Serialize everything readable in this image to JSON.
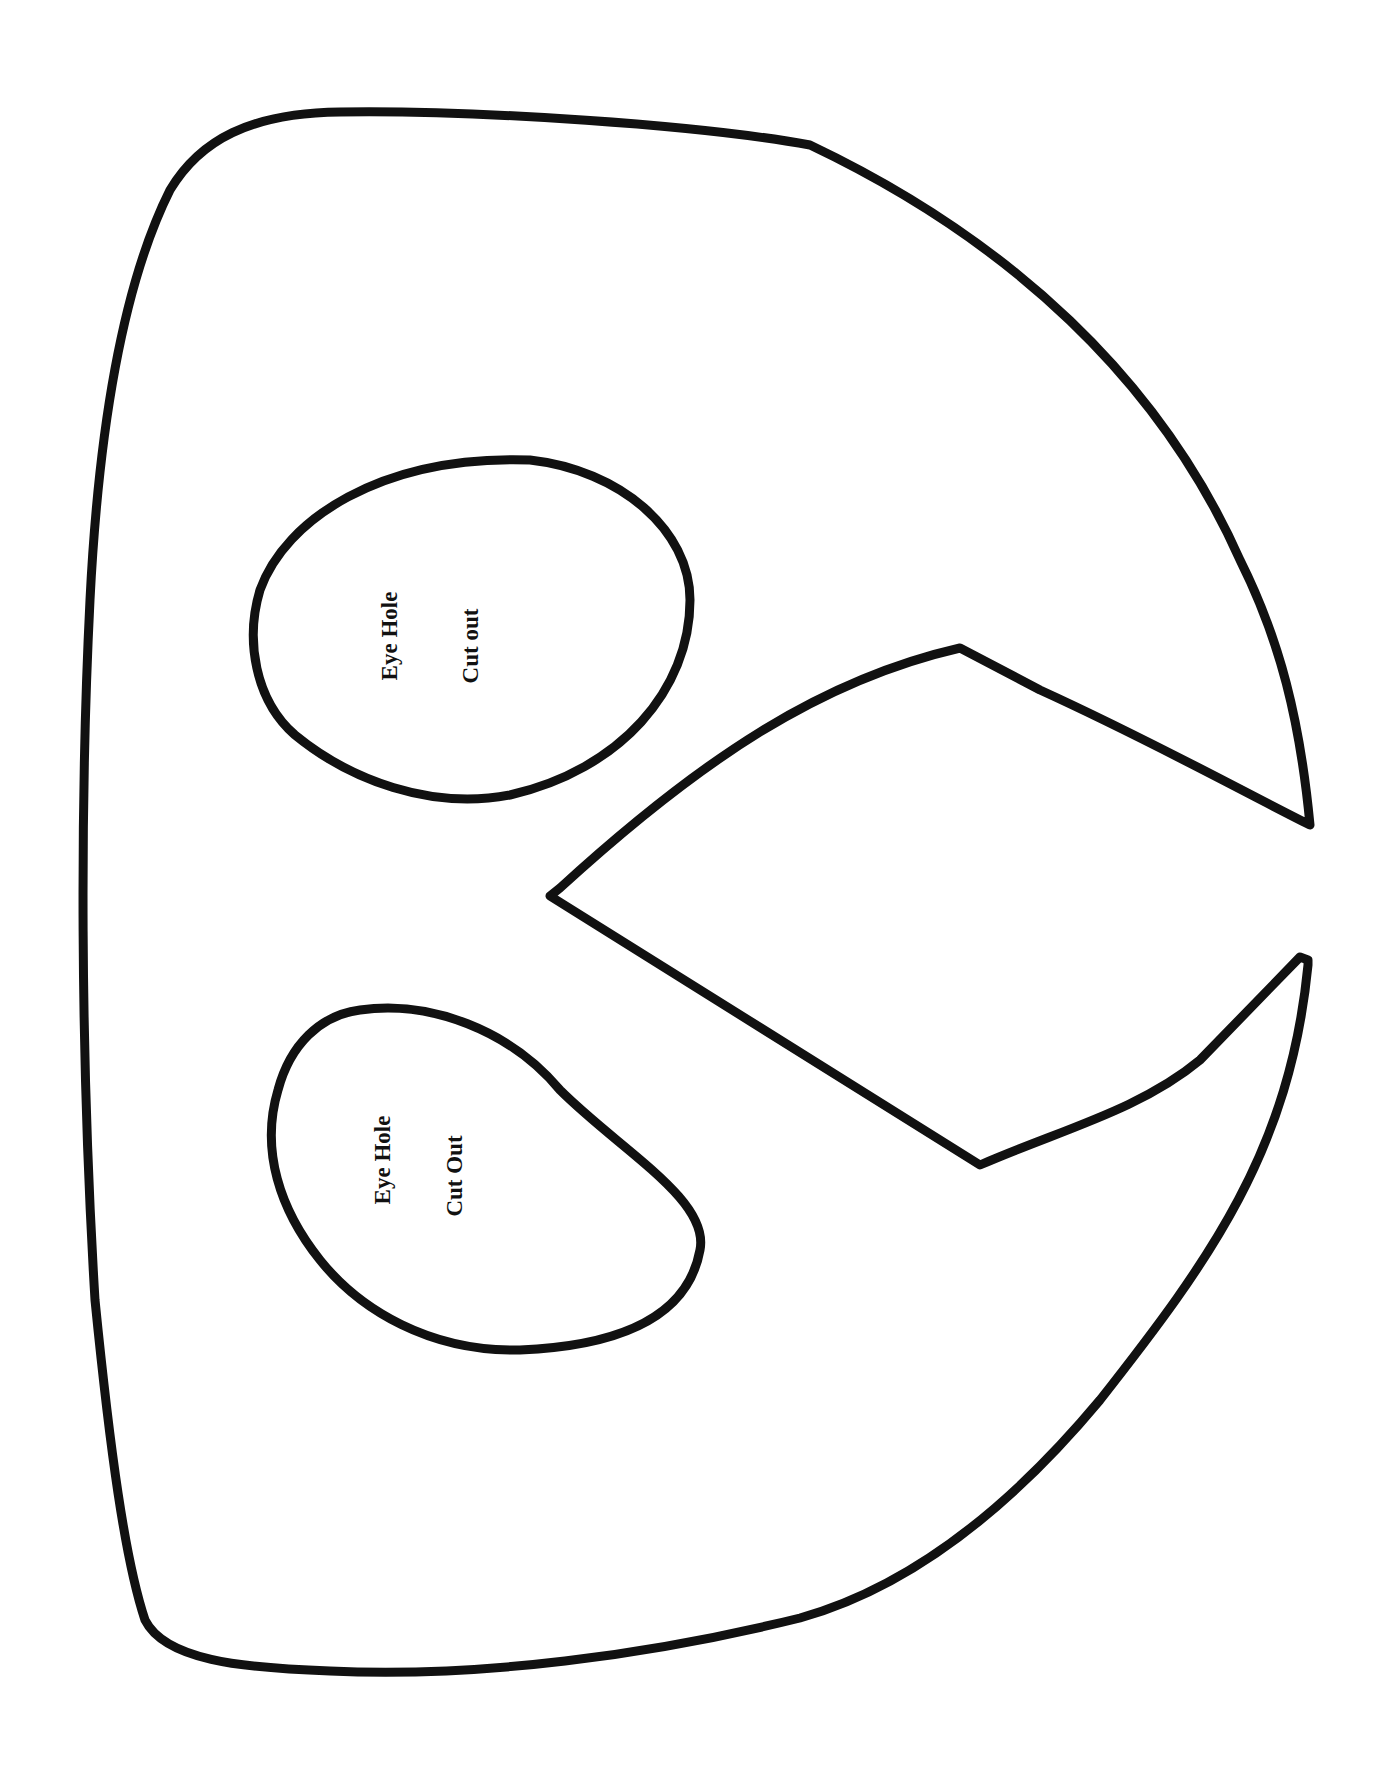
{
  "template": {
    "type": "mask-cutout-template",
    "colors": {
      "background": "#ffffff",
      "stroke": "#111111"
    }
  },
  "eye_holes": [
    {
      "line1": "Eye Hole",
      "line2": "Cut out"
    },
    {
      "line1": "Eye Hole",
      "line2": "Cut Out"
    }
  ]
}
